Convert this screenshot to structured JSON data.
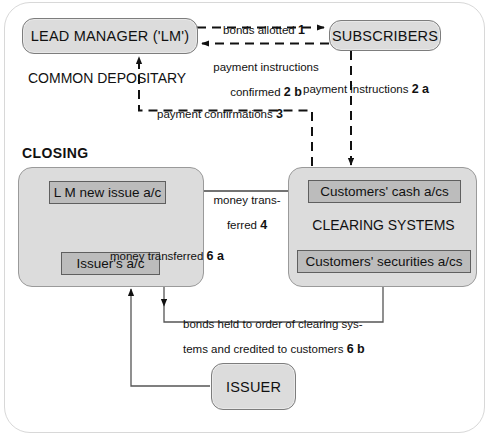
{
  "diagram": {
    "title_hidden": "Eurobond closing flow",
    "section_labels": {
      "common_depositary": "COMMON DEPOSITARY",
      "closing": "CLOSING",
      "clearing_systems": "CLEARING SYSTEMS"
    },
    "nodes": {
      "lead_manager": "LEAD MANAGER ('LM')",
      "subscribers": "SUBSCRIBERS",
      "issuer": "ISSUER",
      "lm_new_issue_ac": "L M new issue a/c",
      "issuers_ac": "Issuer's a/c",
      "customers_cash_acs": "Customers' cash a/cs",
      "customers_securities_acs": "Customers' securities a/cs"
    },
    "flows": {
      "bonds_allotted": {
        "text": "bonds allotted ",
        "step": "1"
      },
      "payment_instructions_confirmed": {
        "line1": "payment instructions",
        "line2": "confirmed ",
        "step": "2 b"
      },
      "payment_instructions": {
        "text": "payment instructions ",
        "step": "2 a"
      },
      "payment_confirmations": {
        "text": "payment confirmations ",
        "step": "3"
      },
      "money_transferred_4": {
        "line1": "money trans-",
        "line2": "ferred ",
        "step": "4"
      },
      "money_transferred_6a": {
        "text": "money transferred ",
        "step": "6 a"
      },
      "bonds_held": {
        "line1": "bonds held to order of clearing sys-",
        "line2": "tems and credited to customers ",
        "step": "6 b"
      }
    },
    "colors": {
      "pill_fill": "#dcdcdc",
      "inner_fill": "#bcbcbc",
      "stroke": "#111111",
      "frame": "#d8d8d8"
    }
  }
}
